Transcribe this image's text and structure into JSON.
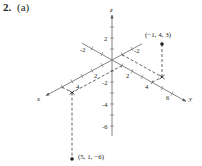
{
  "header": {
    "problem_number": "2.",
    "part": "(a)"
  },
  "diagram": {
    "type": "3d-coordinate-plot",
    "axes": {
      "x": {
        "label": "x",
        "ticks": [
          "2",
          "4"
        ],
        "negative_ticks": [
          "-2"
        ]
      },
      "y": {
        "label": "y",
        "ticks": [
          "2",
          "4",
          "6"
        ],
        "negative_ticks": [
          "-2"
        ]
      },
      "z": {
        "label": "z",
        "ticks": [
          "2"
        ],
        "negative_ticks": [
          "-2",
          "-4",
          "-6"
        ]
      }
    },
    "points": [
      {
        "label": "(−1, 4, 3)",
        "x": -1,
        "y": 4,
        "z": 3
      },
      {
        "label": "(5, 1, −6)",
        "x": 5,
        "y": 1,
        "z": -6
      }
    ],
    "colors": {
      "ink": "#231f20",
      "axis": "#555555",
      "background": "#ffffff"
    }
  }
}
